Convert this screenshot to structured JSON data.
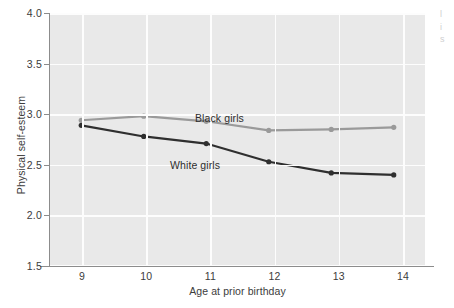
{
  "chart_data": {
    "type": "line",
    "title": "",
    "xlabel": "Age at prior birthday",
    "ylabel": "Physical self-esteem",
    "x": [
      9,
      10,
      11,
      12,
      13,
      14
    ],
    "xticklabels": [
      "9",
      "10",
      "11",
      "12",
      "13",
      "14"
    ],
    "yticklabels": [
      "4.0",
      "3.5",
      "3.0",
      "2.5",
      "2.0",
      "1.5"
    ],
    "yticks": [
      4.0,
      3.5,
      3.0,
      2.5,
      2.0,
      1.5
    ],
    "xlim": [
      8.5,
      14.5
    ],
    "ylim": [
      1.5,
      4.0
    ],
    "grid": true,
    "legend_position": "inline-annotation",
    "series": [
      {
        "name": "Black girls",
        "color": "#9a9a9a",
        "values": [
          2.94,
          2.98,
          2.93,
          2.84,
          2.85,
          2.87
        ]
      },
      {
        "name": "White girls",
        "color": "#2f2f2f",
        "values": [
          2.89,
          2.78,
          2.71,
          2.53,
          2.42,
          2.4
        ]
      }
    ],
    "annotations": [
      {
        "text": "Black girls",
        "series": "Black girls"
      },
      {
        "text": "White girls",
        "series": "White girls"
      }
    ]
  },
  "figure": {
    "background": "#ffffff",
    "plot_background": "#e9e9e9",
    "gridline_color": "#fdfdfd",
    "axis_color": "#8c8c8c",
    "right_edge_fragment": "l\ni\ns"
  }
}
